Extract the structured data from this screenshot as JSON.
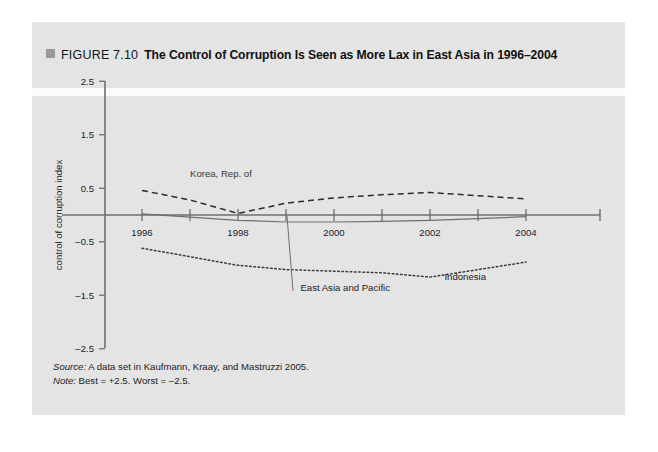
{
  "figure": {
    "bullet_icon": "gray-square-icon",
    "number": "FIGURE 7.10",
    "title": "The Control of Corruption Is Seen as More Lax in East Asia in 1996–2004"
  },
  "footnotes": {
    "source_label": "Source:",
    "source_text": " A data set in Kaufmann, Kraay, and Mastruzzi 2005.",
    "note_label": "Note:",
    "note_text": " Best = +2.5. Worst = –2.5."
  },
  "colors": {
    "panel_background": "#e4e4e4",
    "page_background": "#ffffff",
    "axis": "#6f6f6f",
    "series_korea": "#2b2b2b",
    "series_east_asia": "#6f6f6f",
    "series_indonesia": "#3a3a3a",
    "title_text": "#111111",
    "bullet": "#9a9a9a"
  },
  "chart_data": {
    "type": "line",
    "title": "The Control of Corruption Is Seen as More Lax in East Asia in 1996–2004",
    "xlabel": "",
    "ylabel": "control of corruption index",
    "x": [
      1996,
      1997,
      1998,
      1999,
      2000,
      2001,
      2002,
      2003,
      2004
    ],
    "xtick_labels": [
      "1996",
      "",
      "1998",
      "",
      "2000",
      "",
      "2002",
      "",
      "2004"
    ],
    "xlim": [
      1996,
      2004
    ],
    "ylim": [
      -2.5,
      2.5
    ],
    "ytick_labels": [
      "2.5",
      "1.5",
      "0.5",
      "–0.5",
      "–1.5",
      "–2.5"
    ],
    "yticks": [
      2.5,
      1.5,
      0.5,
      -0.5,
      -1.5,
      -2.5
    ],
    "grid": false,
    "legend_position": "inline-annotations",
    "series": [
      {
        "name": "Korea, Rep. of",
        "style": "dashed",
        "label_x": 1997.0,
        "label_y": 0.72,
        "values": [
          0.46,
          0.28,
          0.03,
          0.22,
          0.32,
          0.38,
          0.42,
          0.36,
          0.3
        ]
      },
      {
        "name": "East Asia and Pacific",
        "style": "solid",
        "label_x": 1999.3,
        "label_y": -1.42,
        "leader_line": true,
        "values": [
          0.02,
          -0.04,
          -0.1,
          -0.13,
          -0.13,
          -0.12,
          -0.1,
          -0.07,
          -0.03
        ]
      },
      {
        "name": "Indonesia",
        "style": "dotted",
        "label_x": 2002.3,
        "label_y": -1.22,
        "values": [
          -0.62,
          -0.78,
          -0.94,
          -1.02,
          -1.05,
          -1.08,
          -1.16,
          -1.02,
          -0.88
        ]
      }
    ]
  }
}
